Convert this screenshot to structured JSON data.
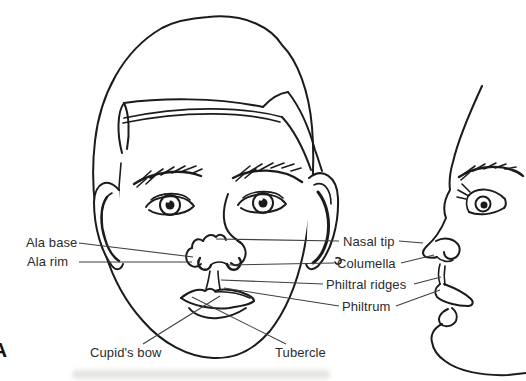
{
  "figure": {
    "panel_letter": "A"
  },
  "colors": {
    "background": "#ffffff",
    "line": "#1b1b1b",
    "leader_line": "#3f3f3f",
    "label_text": "#2b2b2b",
    "scan_artifact": "#dcdcd9"
  },
  "labels": {
    "ala_base": "Ala base",
    "ala_rim": "Ala rim",
    "nasal_tip": "Nasal tip",
    "columella": "Columella",
    "philtral_ridges": "Philtral ridges",
    "philtrum": "Philtrum",
    "cupids_bow": "Cupid's bow",
    "tubercle": "Tubercle"
  }
}
